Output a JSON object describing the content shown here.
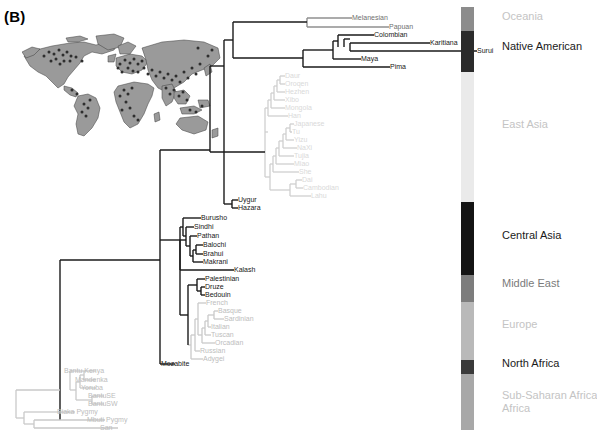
{
  "panel": {
    "label": "(B)"
  },
  "map": {
    "name": "world-map-thumbnail",
    "land_color": "#9a9a9a",
    "outline_color": "#3d3d3d",
    "sample_dot_color": "#333333",
    "background_color": "#ffffff"
  },
  "tree": {
    "line_color_dark": "#1a1a1a",
    "line_color_mid": "#8a8a8a",
    "line_color_light": "#c9c9c9",
    "tips": [
      {
        "label": "Melanesian",
        "x": 352,
        "y": 18,
        "tone": "mid"
      },
      {
        "label": "Papuan",
        "x": 389,
        "y": 27,
        "tone": "mid"
      },
      {
        "label": "Colombian",
        "x": 374,
        "y": 35,
        "tone": "dark"
      },
      {
        "label": "Karitiana",
        "x": 430,
        "y": 43,
        "tone": "dark"
      },
      {
        "label": "Surui",
        "x": 477,
        "y": 51,
        "tone": "dark"
      },
      {
        "label": "Maya",
        "x": 361,
        "y": 59,
        "tone": "dark"
      },
      {
        "label": "Pima",
        "x": 390,
        "y": 67,
        "tone": "dark"
      },
      {
        "label": "Daur",
        "x": 285,
        "y": 76,
        "tone": "vlight"
      },
      {
        "label": "Oroqen",
        "x": 285,
        "y": 84,
        "tone": "vlight"
      },
      {
        "label": "Hezhen",
        "x": 285,
        "y": 92,
        "tone": "vlight"
      },
      {
        "label": "Xibo",
        "x": 285,
        "y": 100,
        "tone": "vlight"
      },
      {
        "label": "Mongola",
        "x": 285,
        "y": 108,
        "tone": "vlight"
      },
      {
        "label": "Han",
        "x": 288,
        "y": 116,
        "tone": "vlight"
      },
      {
        "label": "Japanese",
        "x": 294,
        "y": 124,
        "tone": "vlight"
      },
      {
        "label": "Tu",
        "x": 292,
        "y": 132,
        "tone": "vlight"
      },
      {
        "label": "Yizu",
        "x": 294,
        "y": 140,
        "tone": "vlight"
      },
      {
        "label": "NaXi",
        "x": 297,
        "y": 148,
        "tone": "vlight"
      },
      {
        "label": "Tujia",
        "x": 294,
        "y": 156,
        "tone": "vlight"
      },
      {
        "label": "Miao",
        "x": 294,
        "y": 164,
        "tone": "vlight"
      },
      {
        "label": "She",
        "x": 299,
        "y": 172,
        "tone": "vlight"
      },
      {
        "label": "Dai",
        "x": 302,
        "y": 180,
        "tone": "vlight"
      },
      {
        "label": "Cambodian",
        "x": 303,
        "y": 188,
        "tone": "vlight"
      },
      {
        "label": "Lahu",
        "x": 311,
        "y": 196,
        "tone": "vlight"
      },
      {
        "label": "Uygur",
        "x": 238,
        "y": 200,
        "tone": "dark"
      },
      {
        "label": "Hazara",
        "x": 238,
        "y": 208,
        "tone": "dark"
      },
      {
        "label": "Burusho",
        "x": 201,
        "y": 218,
        "tone": "dark"
      },
      {
        "label": "Sindhi",
        "x": 194,
        "y": 227,
        "tone": "dark"
      },
      {
        "label": "Pathan",
        "x": 197,
        "y": 236,
        "tone": "dark"
      },
      {
        "label": "Balochi",
        "x": 203,
        "y": 245,
        "tone": "dark"
      },
      {
        "label": "Brahui",
        "x": 203,
        "y": 254,
        "tone": "dark"
      },
      {
        "label": "Makrani",
        "x": 203,
        "y": 262,
        "tone": "dark"
      },
      {
        "label": "Kalash",
        "x": 234,
        "y": 270,
        "tone": "dark"
      },
      {
        "label": "Palestinian",
        "x": 205,
        "y": 279,
        "tone": "dark"
      },
      {
        "label": "Druze",
        "x": 205,
        "y": 287,
        "tone": "dark"
      },
      {
        "label": "Bedouin",
        "x": 205,
        "y": 295,
        "tone": "dark"
      },
      {
        "label": "French",
        "x": 206,
        "y": 303,
        "tone": "light"
      },
      {
        "label": "Basque",
        "x": 218,
        "y": 311,
        "tone": "light"
      },
      {
        "label": "Sardinian",
        "x": 224,
        "y": 319,
        "tone": "light"
      },
      {
        "label": "Italian",
        "x": 211,
        "y": 327,
        "tone": "light"
      },
      {
        "label": "Tuscan",
        "x": 211,
        "y": 335,
        "tone": "light"
      },
      {
        "label": "Orcadian",
        "x": 215,
        "y": 343,
        "tone": "light"
      },
      {
        "label": "Russian",
        "x": 200,
        "y": 351,
        "tone": "light"
      },
      {
        "label": "Adygei",
        "x": 203,
        "y": 359,
        "tone": "light"
      },
      {
        "label": "Mozabite",
        "x": 161,
        "y": 364,
        "tone": "dark"
      },
      {
        "label": "Bantu Kenya",
        "x": 64,
        "y": 371,
        "tone": "light"
      },
      {
        "label": "Mandenka",
        "x": 75,
        "y": 380,
        "tone": "light"
      },
      {
        "label": "Yoruba",
        "x": 81,
        "y": 388,
        "tone": "light"
      },
      {
        "label": "BantuSE",
        "x": 88,
        "y": 396,
        "tone": "light"
      },
      {
        "label": "BantuSW",
        "x": 88,
        "y": 404,
        "tone": "light"
      },
      {
        "label": "Biaka Pygmy",
        "x": 57,
        "y": 412,
        "tone": "light"
      },
      {
        "label": "Mbuti Pygmy",
        "x": 87,
        "y": 420,
        "tone": "light"
      },
      {
        "label": "San",
        "x": 100,
        "y": 428,
        "tone": "light"
      }
    ]
  },
  "colorbar": {
    "name": "region-colour-bar",
    "segments": [
      {
        "region": "Oceania",
        "color": "#8c8c8c",
        "top": 0,
        "height": 24
      },
      {
        "region": "Native American",
        "color": "#2b2b2b",
        "top": 24,
        "height": 41
      },
      {
        "region": "East Asia",
        "color": "#eaeaea",
        "top": 65,
        "height": 130
      },
      {
        "region": "Central Asia",
        "color": "#141414",
        "top": 195,
        "height": 73
      },
      {
        "region": "Middle East",
        "color": "#7d7d7d",
        "top": 268,
        "height": 27
      },
      {
        "region": "Europe",
        "color": "#b9b9b9",
        "top": 295,
        "height": 58
      },
      {
        "region": "North Africa",
        "color": "#3a3a3a",
        "top": 353,
        "height": 14
      },
      {
        "region": "Sub-Saharan Africa",
        "color": "#a8a8a8",
        "top": 367,
        "height": 56
      }
    ]
  },
  "regions": [
    {
      "label": "Oceania",
      "top": 10,
      "tone": "light"
    },
    {
      "label": "Native American",
      "top": 40,
      "tone": "dark"
    },
    {
      "label": "East Asia",
      "top": 118,
      "tone": "light"
    },
    {
      "label": "Central Asia",
      "top": 229,
      "tone": "dark"
    },
    {
      "label": "Middle East",
      "top": 277,
      "tone": "mid"
    },
    {
      "label": "Europe",
      "top": 318,
      "tone": "light"
    },
    {
      "label": "North Africa",
      "top": 357,
      "tone": "dark"
    },
    {
      "label": "Sub-Saharan Africa",
      "top": 389,
      "tone": "light",
      "line2": "Africa"
    }
  ]
}
